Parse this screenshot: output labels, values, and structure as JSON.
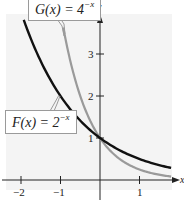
{
  "chart_data": {
    "type": "line",
    "title": "",
    "xlabel": "x",
    "ylabel": "y",
    "xlim": [
      -2.4,
      1.9
    ],
    "ylim": [
      0,
      4
    ],
    "x_ticks": [
      -2,
      -1,
      1
    ],
    "x_tick_labels": [
      "−2",
      "−1",
      "1"
    ],
    "y_ticks": [
      1,
      2,
      3
    ],
    "y_tick_labels": [
      "1",
      "2",
      "3"
    ],
    "grid": false,
    "series": [
      {
        "name": "F(x) = 2^-x",
        "color": "#111111",
        "x": [
          -1.93,
          -1.5,
          -1,
          -0.5,
          0,
          0.5,
          1,
          1.5,
          1.8
        ],
        "values": [
          3.81,
          2.83,
          2.0,
          1.41,
          1.0,
          0.71,
          0.5,
          0.35,
          0.29
        ]
      },
      {
        "name": "G(x) = 4^-x",
        "color": "#9a9a9a",
        "x": [
          -0.93,
          -0.75,
          -0.5,
          -0.25,
          0,
          0.25,
          0.5,
          1,
          1.5,
          1.8
        ],
        "values": [
          3.63,
          2.83,
          2.0,
          1.41,
          1.0,
          0.71,
          0.5,
          0.25,
          0.125,
          0.08
        ]
      }
    ],
    "annotations": [
      {
        "text": "G(x) = 4^-x",
        "points_to": "G curve near x = -0.85"
      },
      {
        "text": "F(x) = 2^-x",
        "points_to": "F curve near x = -1.0"
      }
    ]
  },
  "labels": {
    "x_axis": "x",
    "y_axis": "y",
    "tick_x_neg2": "−2",
    "tick_x_neg1": "−1",
    "tick_x_1": "1",
    "tick_y_1": "1",
    "tick_y_2": "2",
    "tick_y_3": "3"
  },
  "callouts": {
    "g": {
      "prefix": "G(x) = 4",
      "exp": "−x"
    },
    "f": {
      "prefix": "F(x) = 2",
      "exp": "−x"
    }
  },
  "colors": {
    "f_curve": "#111111",
    "g_curve": "#9a9a9a",
    "axis": "#222222",
    "plot_bg": "#f4f4f4"
  }
}
